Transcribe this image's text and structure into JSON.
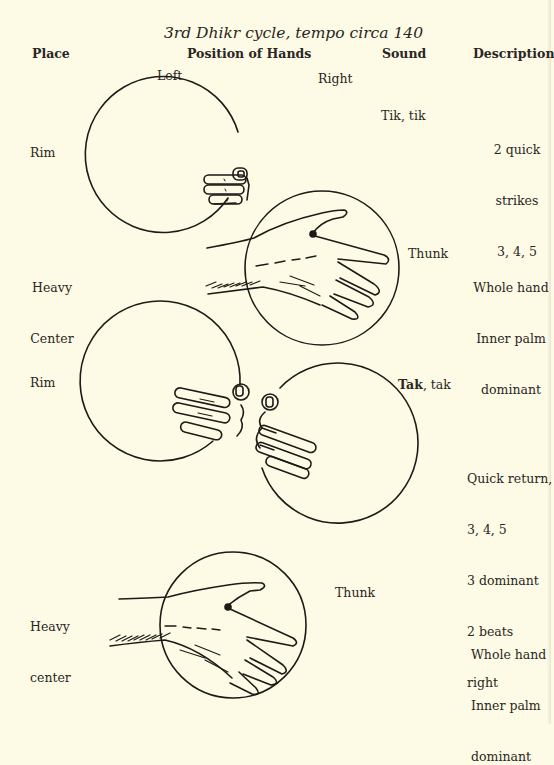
{
  "title": "3rd Dhikr cycle, tempo circa 140",
  "headers": {
    "place": "Place",
    "position": "Position of Hands",
    "sound": "Sound",
    "description": "Description"
  },
  "subheaders": {
    "left": "Left",
    "right": "Right"
  },
  "rows": [
    {
      "place": "Rim",
      "sound": "Tik, tik",
      "description": [
        "2 quick",
        "strikes",
        "3, 4, 5"
      ],
      "figure": "left-hand-fingers-on-rim"
    },
    {
      "place": [
        "Heavy",
        "Center"
      ],
      "sound": "Thunk",
      "description": [
        "Whole hand",
        "Inner palm",
        "dominant"
      ],
      "figure": "right-hand-flat-on-center"
    },
    {
      "place": "Rim",
      "sound_bold": "Tak",
      "sound_rest": ", tak",
      "description": [
        "Quick return,",
        "3, 4, 5",
        "3 dominant",
        "2 beats",
        "right"
      ],
      "figure": "both-hands-fingers-on-rim"
    },
    {
      "place": [
        "Heavy",
        "center"
      ],
      "sound": "Thunk",
      "description": [
        "Whole hand",
        "Inner palm",
        "dominant"
      ],
      "figure": "right-hand-flat-on-center"
    }
  ]
}
